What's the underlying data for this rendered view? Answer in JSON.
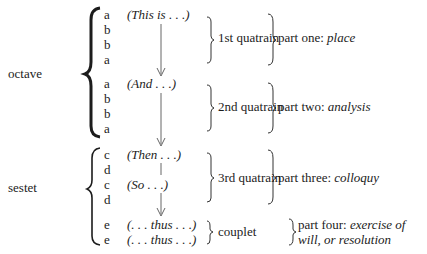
{
  "sections": [
    {
      "label": "octave",
      "y": 74
    },
    {
      "label": "sestet",
      "y": 188
    }
  ],
  "rhyme_lines": [
    {
      "letter": "a",
      "y": 8,
      "phrase": "(This is . . .)"
    },
    {
      "letter": "b",
      "y": 23,
      "phrase": ""
    },
    {
      "letter": "b",
      "y": 38,
      "phrase": ""
    },
    {
      "letter": "a",
      "y": 53,
      "phrase": ""
    },
    {
      "letter": "a",
      "y": 77,
      "phrase": "(And . . .)"
    },
    {
      "letter": "b",
      "y": 92,
      "phrase": ""
    },
    {
      "letter": "b",
      "y": 107,
      "phrase": ""
    },
    {
      "letter": "a",
      "y": 122,
      "phrase": ""
    },
    {
      "letter": "c",
      "y": 148,
      "phrase": "(Then . . .)"
    },
    {
      "letter": "d",
      "y": 163,
      "phrase": ""
    },
    {
      "letter": "c",
      "y": 178,
      "phrase": "(So . . .)"
    },
    {
      "letter": "d",
      "y": 193,
      "phrase": ""
    },
    {
      "letter": "e",
      "y": 218,
      "phrase": "(. . . thus . . .)"
    },
    {
      "letter": "e",
      "y": 233,
      "phrase": "(. . . thus . . .)"
    }
  ],
  "units": [
    {
      "label": "1st quatrain",
      "y": 31
    },
    {
      "label": "2nd quatrain",
      "y": 100
    },
    {
      "label": "3rd quatrain",
      "y": 171
    },
    {
      "label": "couplet",
      "y": 226
    }
  ],
  "parts": [
    {
      "prefix": "part one: ",
      "emph": "place",
      "y": 31
    },
    {
      "prefix": "part two: ",
      "emph": "analysis",
      "y": 100
    },
    {
      "prefix": "part three: ",
      "emph": "colloquy",
      "y": 171
    },
    {
      "prefix": "part four: ",
      "emph": "exercise of",
      "emph2": "will, or resolution",
      "y": 218
    }
  ]
}
